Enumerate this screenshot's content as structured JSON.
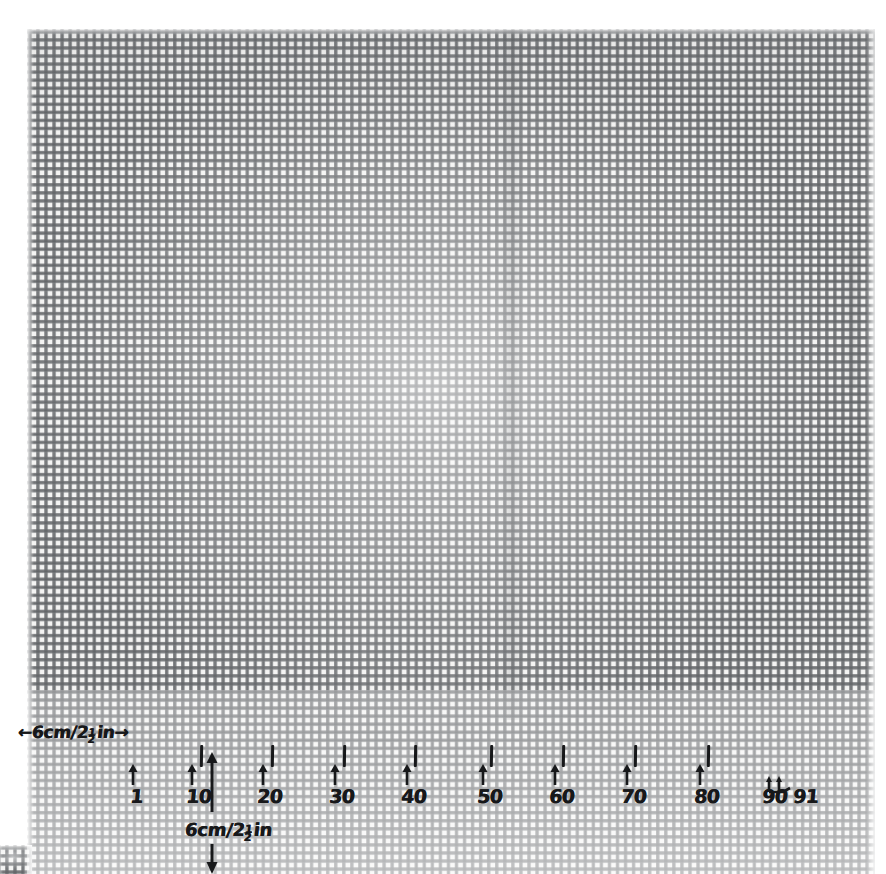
{
  "image": {
    "subject": "woven-mesh-canvas-with-handwritten-scale-annotations",
    "background_color": "#ffffff",
    "mesh_thread_color": "#686a6d",
    "ink_color": "#17181a"
  },
  "annotations": {
    "horizontal_scale": {
      "label": "6cm/2½in",
      "prefix": "←",
      "suffix": "→",
      "number": "6",
      "unit_cm": "cm",
      "slash": "/",
      "inches_whole": "2",
      "frac_num": "1",
      "frac_den": "2",
      "unit_in": "in"
    },
    "vertical_scale": {
      "label": "6cm/2½in",
      "number": "6",
      "unit_cm": "cm",
      "slash": "/",
      "inches_whole": "2",
      "frac_num": "1",
      "frac_den": "2",
      "unit_in": "in"
    },
    "ticks": [
      {
        "label": "1",
        "x": 130,
        "has_hash": false,
        "arrow_x": 133
      },
      {
        "label": "10",
        "x": 186,
        "has_hash": true,
        "arrow_x": 192,
        "hash_x": 200
      },
      {
        "label": "20",
        "x": 257,
        "has_hash": true,
        "arrow_x": 263,
        "hash_x": 271
      },
      {
        "label": "30",
        "x": 329,
        "has_hash": true,
        "arrow_x": 335,
        "hash_x": 343
      },
      {
        "label": "40",
        "x": 401,
        "has_hash": true,
        "arrow_x": 407,
        "hash_x": 414
      },
      {
        "label": "50",
        "x": 477,
        "has_hash": true,
        "arrow_x": 483,
        "hash_x": 490
      },
      {
        "label": "60",
        "x": 549,
        "has_hash": true,
        "arrow_x": 555,
        "hash_x": 562
      },
      {
        "label": "70",
        "x": 621,
        "has_hash": true,
        "arrow_x": 627,
        "hash_x": 634
      },
      {
        "label": "80",
        "x": 694,
        "has_hash": true,
        "arrow_x": 700,
        "hash_x": 707
      },
      {
        "label": "90",
        "x": 762,
        "has_hash": false,
        "arrow_x": 770
      },
      {
        "label": "91",
        "x": 793,
        "has_hash": false,
        "arrow_x": 782
      }
    ],
    "counts": {
      "first": "1",
      "last": "91",
      "total_marked": "91"
    }
  },
  "chart_data": {
    "type": "scatter",
    "xlabel": "mesh / hole number",
    "ylabel": "",
    "categories": [
      "1",
      "10",
      "20",
      "30",
      "40",
      "50",
      "60",
      "70",
      "80",
      "90",
      "91"
    ],
    "values": [
      1,
      10,
      20,
      30,
      40,
      50,
      60,
      70,
      80,
      90,
      91
    ],
    "x": [
      130,
      192,
      263,
      335,
      407,
      483,
      555,
      627,
      700,
      770,
      782
    ],
    "annotations": [
      "←6cm/2½in→ horizontal span from left edge to mesh 1",
      "6cm/2½in vertical span measured downward at mesh 14"
    ],
    "xlim": [
      1,
      91
    ],
    "grid": true,
    "legend": "none"
  }
}
